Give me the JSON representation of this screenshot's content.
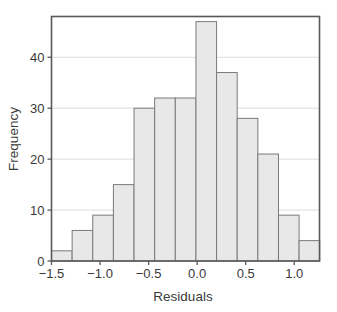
{
  "chart_data": {
    "type": "bar",
    "title": "",
    "subtitle": "",
    "xlabel": "Residuals",
    "ylabel": "Frequency",
    "xlim": [
      -1.5,
      1.26
    ],
    "ylim": [
      0,
      48
    ],
    "grid": true,
    "grid_axis": "y",
    "legend": null,
    "bin_width": 0.2125,
    "bin_edges": [
      -1.5,
      -1.2875,
      -1.075,
      -0.8625,
      -0.65,
      -0.4375,
      -0.225,
      -0.0125,
      0.2,
      0.4125,
      0.625,
      0.8375,
      1.05,
      1.2625
    ],
    "bin_centers": [
      -1.394,
      -1.181,
      -0.969,
      -0.756,
      -0.544,
      -0.331,
      -0.119,
      0.094,
      0.306,
      0.519,
      0.731,
      0.944,
      1.156
    ],
    "values": [
      2,
      6,
      9,
      15,
      30,
      32,
      32,
      47,
      37,
      28,
      21,
      9,
      4
    ],
    "categories": [
      "bin1",
      "bin2",
      "bin3",
      "bin4",
      "bin5",
      "bin6",
      "bin7",
      "bin8",
      "bin9",
      "bin10",
      "bin11",
      "bin12",
      "bin13"
    ],
    "x_ticks": [
      -1.5,
      -1.0,
      -0.5,
      0.0,
      0.5,
      1.0
    ],
    "x_tick_labels": [
      "−1.5",
      "−1.0",
      "−0.5",
      "0.0",
      "0.5",
      "1.0"
    ],
    "y_ticks": [
      0,
      10,
      20,
      30,
      40
    ],
    "y_tick_labels": [
      "0",
      "10",
      "20",
      "30",
      "40"
    ],
    "colors": {
      "bar_fill": "#e8e8e8",
      "bar_stroke": "#7a7a7a",
      "frame": "#595959",
      "gridline": "#dcdcdc",
      "text": "#3a3a3a",
      "background": "#ffffff"
    }
  }
}
